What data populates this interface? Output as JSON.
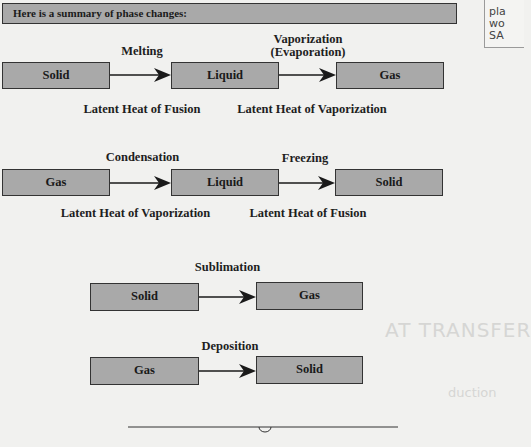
{
  "header": {
    "text": "Here is a summary of phase changes:"
  },
  "sidenote": {
    "lines": [
      "pla",
      "wo",
      "SA"
    ]
  },
  "rows": [
    {
      "boxes": [
        "Solid",
        "Liquid",
        "Gas"
      ],
      "process_labels": [
        "Melting",
        "Vaporization\n(Evaporation)"
      ],
      "process_label_lines": [
        [
          "Melting"
        ],
        [
          "Vaporization",
          "(Evaporation)"
        ]
      ],
      "heat_labels": [
        "Latent Heat of Fusion",
        "Latent Heat of Vaporization"
      ]
    },
    {
      "boxes": [
        "Gas",
        "Liquid",
        "Solid"
      ],
      "process_labels": [
        "Condensation",
        "Freezing"
      ],
      "heat_labels": [
        "Latent Heat of Vaporization",
        "Latent Heat of Fusion"
      ]
    },
    {
      "boxes": [
        "Solid",
        "Gas"
      ],
      "process_labels": [
        "Sublimation"
      ]
    },
    {
      "boxes": [
        "Gas",
        "Solid"
      ],
      "process_labels": [
        "Deposition"
      ]
    }
  ],
  "background_text": {
    "heading_fragment": "AT TRANSFER",
    "subheading_fragment": "duction"
  },
  "colors": {
    "box_fill": "#a9a9a9",
    "box_border": "#333333",
    "page_bg": "#f1f1ef",
    "text": "#1c1c1c"
  }
}
